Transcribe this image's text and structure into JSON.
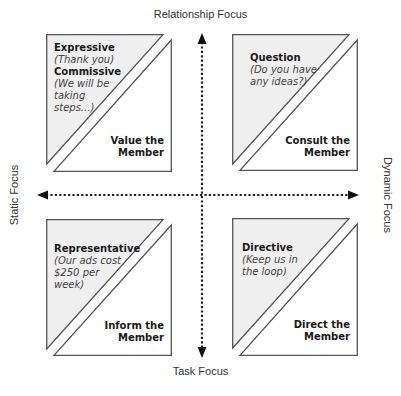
{
  "axes": {
    "top": "Relationship Focus",
    "bottom": "Task Focus",
    "left": "Static Focus",
    "right": "Dynamic Focus"
  },
  "colors": {
    "triangle_fill": "#efefef",
    "stroke": "#555555",
    "axis": "#222222"
  },
  "quadrants": {
    "top_left": {
      "entries": [
        {
          "title": "Expressive",
          "example": "(Thank you)"
        },
        {
          "title": "Commissive",
          "example_lines": [
            "(We will be",
            "taking",
            "steps...)"
          ]
        }
      ],
      "action_lines": [
        "Value the",
        "Member"
      ]
    },
    "top_right": {
      "title": "Question",
      "example_lines": [
        "(Do you have",
        "any ideas?)"
      ],
      "action_lines": [
        "Consult the",
        "Member"
      ]
    },
    "bottom_left": {
      "title": "Representative",
      "example_lines": [
        "(Our ads cost",
        "$250 per",
        "week)"
      ],
      "action_lines": [
        "Inform the",
        "Member"
      ]
    },
    "bottom_right": {
      "title": "Directive",
      "example_lines": [
        "(Keep us in",
        "the loop)"
      ],
      "action_lines": [
        "Direct the",
        "Member"
      ]
    }
  }
}
